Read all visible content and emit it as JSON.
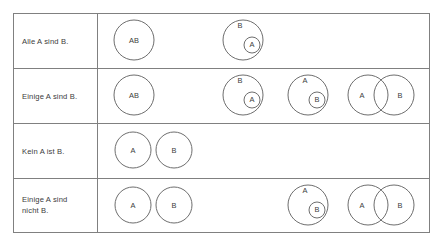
{
  "figure": {
    "kind": "euler-diagram-table",
    "language": "de",
    "background_color": "#ffffff",
    "border_color": "#808080",
    "circle_stroke_color": "#6e6e6e",
    "text_color": "#3c3c3c"
  },
  "table": {
    "x": 13,
    "y": 13,
    "width": 417,
    "height": 220,
    "label_column_width": 84,
    "rows": [
      {
        "id": "alle-a-sind-b",
        "label": "Alle A sind B.",
        "label_lines": [
          "Alle A sind B."
        ],
        "y": 13,
        "height": 55,
        "diagrams": [
          {
            "id": "alle-a-sind-b-d1",
            "type": "coincident",
            "label": "AB",
            "circles": [
              {
                "name": "AB",
                "cx": 134,
                "cy": 40,
                "r": 20,
                "label": "AB",
                "label_x": 134,
                "label_y": 41
              }
            ]
          },
          {
            "id": "alle-a-sind-b-d2",
            "type": "a-inside-b",
            "circles": [
              {
                "name": "B",
                "cx": 243,
                "cy": 40,
                "r": 20,
                "label": "B",
                "label_x": 240,
                "label_y": 26
              },
              {
                "name": "A",
                "cx": 252,
                "cy": 45,
                "r": 8,
                "label": "A",
                "label_x": 252,
                "label_y": 45
              }
            ]
          }
        ]
      },
      {
        "id": "einige-a-sind-b",
        "label": "Einige A sind B.",
        "label_lines": [
          "Einige A sind B."
        ],
        "y": 68,
        "height": 55,
        "diagrams": [
          {
            "id": "einige-a-sind-b-d1",
            "type": "coincident",
            "label": "AB",
            "circles": [
              {
                "name": "AB",
                "cx": 134,
                "cy": 95,
                "r": 20,
                "label": "AB",
                "label_x": 134,
                "label_y": 96
              }
            ]
          },
          {
            "id": "einige-a-sind-b-d2",
            "type": "a-inside-b",
            "circles": [
              {
                "name": "B",
                "cx": 243,
                "cy": 95,
                "r": 20,
                "label": "B",
                "label_x": 240,
                "label_y": 81
              },
              {
                "name": "A",
                "cx": 252,
                "cy": 100,
                "r": 8,
                "label": "A",
                "label_x": 252,
                "label_y": 100
              }
            ]
          },
          {
            "id": "einige-a-sind-b-d3",
            "type": "b-inside-a",
            "circles": [
              {
                "name": "A",
                "cx": 308,
                "cy": 95,
                "r": 20,
                "label": "A",
                "label_x": 305,
                "label_y": 81
              },
              {
                "name": "B",
                "cx": 317,
                "cy": 100,
                "r": 8,
                "label": "B",
                "label_x": 317,
                "label_y": 100
              }
            ]
          },
          {
            "id": "einige-a-sind-b-d4",
            "type": "overlap",
            "circles": [
              {
                "name": "A",
                "cx": 368,
                "cy": 95,
                "r": 20,
                "label": "A",
                "label_x": 362,
                "label_y": 96
              },
              {
                "name": "B",
                "cx": 394,
                "cy": 95,
                "r": 20,
                "label": "B",
                "label_x": 400,
                "label_y": 96
              }
            ]
          }
        ]
      },
      {
        "id": "kein-a-ist-b",
        "label": "Kein A ist B.",
        "label_lines": [
          "Kein A ist B."
        ],
        "y": 123,
        "height": 55,
        "diagrams": [
          {
            "id": "kein-a-ist-b-d1",
            "type": "disjoint",
            "circles": [
              {
                "name": "A",
                "cx": 133,
                "cy": 150,
                "r": 18,
                "label": "A",
                "label_x": 133,
                "label_y": 151
              },
              {
                "name": "B",
                "cx": 174,
                "cy": 150,
                "r": 18,
                "label": "B",
                "label_x": 174,
                "label_y": 151
              }
            ]
          }
        ]
      },
      {
        "id": "einige-a-sind-nicht-b",
        "label": "Einige A sind nicht B.",
        "label_lines": [
          "Einige A sind",
          "nicht B."
        ],
        "y": 178,
        "height": 55,
        "diagrams": [
          {
            "id": "einige-a-sind-nicht-b-d1",
            "type": "disjoint",
            "circles": [
              {
                "name": "A",
                "cx": 133,
                "cy": 205,
                "r": 18,
                "label": "A",
                "label_x": 133,
                "label_y": 206
              },
              {
                "name": "B",
                "cx": 174,
                "cy": 205,
                "r": 18,
                "label": "B",
                "label_x": 174,
                "label_y": 206
              }
            ]
          },
          {
            "id": "einige-a-sind-nicht-b-d2",
            "type": "b-inside-a",
            "circles": [
              {
                "name": "A",
                "cx": 308,
                "cy": 205,
                "r": 20,
                "label": "A",
                "label_x": 305,
                "label_y": 191
              },
              {
                "name": "B",
                "cx": 317,
                "cy": 210,
                "r": 8,
                "label": "B",
                "label_x": 317,
                "label_y": 210
              }
            ]
          },
          {
            "id": "einige-a-sind-nicht-b-d3",
            "type": "overlap",
            "circles": [
              {
                "name": "A",
                "cx": 368,
                "cy": 205,
                "r": 20,
                "label": "A",
                "label_x": 362,
                "label_y": 206
              },
              {
                "name": "B",
                "cx": 394,
                "cy": 205,
                "r": 20,
                "label": "B",
                "label_x": 400,
                "label_y": 206
              }
            ]
          }
        ]
      }
    ]
  }
}
